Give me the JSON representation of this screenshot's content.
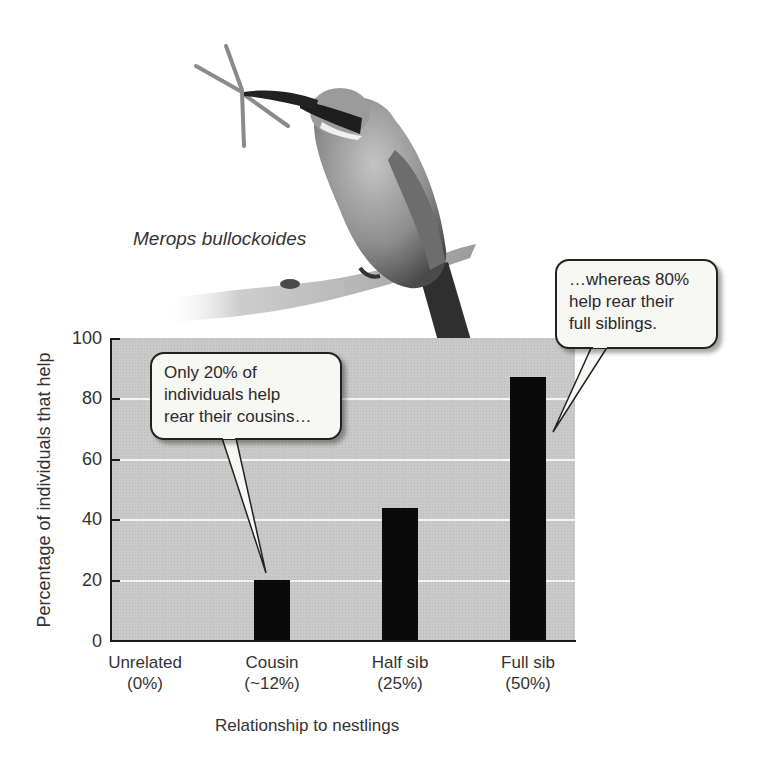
{
  "figure": {
    "species_label": "Merops bullockoides",
    "photo_subject": "bee-eater bird perched on branch holding insect"
  },
  "axes": {
    "ylabel": "Percentage of individuals that help",
    "xlabel": "Relationship to nestlings",
    "yticks": [
      "0",
      "20",
      "40",
      "60",
      "80",
      "100"
    ],
    "categories": [
      {
        "name": "Unrelated",
        "relatedness": "(0%)"
      },
      {
        "name": "Cousin",
        "relatedness": "(~12%)"
      },
      {
        "name": "Half sib",
        "relatedness": "(25%)"
      },
      {
        "name": "Full sib",
        "relatedness": "(50%)"
      }
    ]
  },
  "callouts": {
    "left": {
      "lines": [
        "Only 20% of",
        "individuals help",
        "rear their cousins…"
      ]
    },
    "right": {
      "lines": [
        "…whereas 80%",
        "help rear their",
        "full siblings."
      ]
    }
  },
  "colors": {
    "plot_background": "#c9c9c9",
    "bar": "#0a0a0a",
    "gridline": "#f4f4f4",
    "callout_fill": "#f7f7f4"
  },
  "chart_data": {
    "type": "bar",
    "title": "",
    "categories": [
      "Unrelated (0%)",
      "Cousin (~12%)",
      "Half sib (25%)",
      "Full sib (50%)"
    ],
    "values": [
      0,
      20,
      44,
      87
    ],
    "xlabel": "Relationship to nestlings",
    "ylabel": "Percentage of individuals that help",
    "ylim": [
      0,
      100
    ],
    "yticks": [
      0,
      20,
      40,
      60,
      80,
      100
    ],
    "grid": "horizontal white gridlines at 20, 40, 60, 80",
    "legend": null,
    "annotations": [
      {
        "text": "Only 20% of individuals help rear their cousins…",
        "points_to": "Cousin"
      },
      {
        "text": "…whereas 80% help rear their full siblings.",
        "points_to": "Full sib"
      },
      {
        "text": "Merops bullockoides",
        "type": "species label for photo"
      }
    ]
  }
}
